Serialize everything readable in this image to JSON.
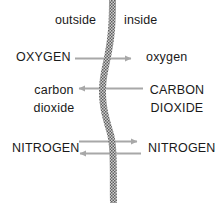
{
  "diagram": {
    "colors": {
      "background": "#ffffff",
      "text": "#1a1a1a",
      "arrow": "#a8a8a8",
      "membrane_dark": "#6e6e6e",
      "membrane_light": "#c9c9c9"
    },
    "header": {
      "outside_label": "outside",
      "inside_label": "inside"
    },
    "membrane": {
      "name": "membrane",
      "style": "wavy stippled vertical band"
    },
    "rows": [
      {
        "id": "oxygen",
        "outside_label": "OXYGEN",
        "inside_label": "oxygen",
        "arrows": [
          "right"
        ]
      },
      {
        "id": "carbon-dioxide",
        "outside_label_line1": "carbon",
        "outside_label_line2": "dioxide",
        "inside_label_line1": "CARBON",
        "inside_label_line2": "DIOXIDE",
        "arrows": [
          "left"
        ]
      },
      {
        "id": "nitrogen",
        "outside_label": "NITROGEN",
        "inside_label": "NITROGEN",
        "arrows": [
          "right",
          "left"
        ]
      }
    ]
  }
}
